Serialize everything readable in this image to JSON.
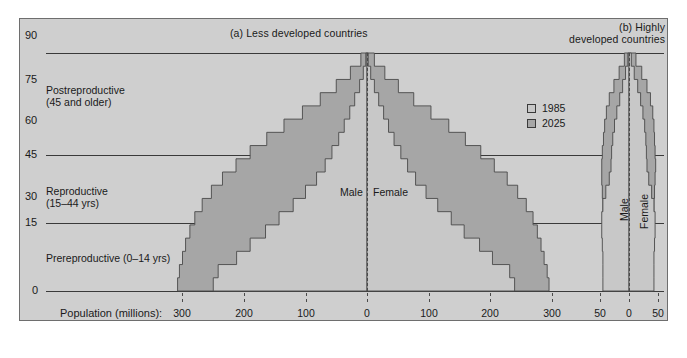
{
  "panels": {
    "left": {
      "title": "(a) Less developed countries"
    },
    "right": {
      "title_line1": "(b) Highly",
      "title_line2": "developed countries"
    }
  },
  "legend": {
    "position": "inside-right-upper",
    "items": [
      {
        "label": "1985",
        "color": "#c8c8c8"
      },
      {
        "label": "2025",
        "color": "#a6a6a6"
      }
    ]
  },
  "axis": {
    "x_title": "Population (millions):",
    "y_ticks": [
      "0",
      "15",
      "30",
      "45",
      "60",
      "75",
      "90"
    ],
    "x_ticks_left": [
      "300",
      "200",
      "100",
      "0",
      "100",
      "200",
      "300"
    ],
    "x_ticks_right": [
      "50",
      "0",
      "50"
    ],
    "gridlines_at": [
      0,
      15,
      45,
      90
    ]
  },
  "age_categories": [
    {
      "name": "Postreproductive",
      "range": "(45 and older)"
    },
    {
      "name": "Reproductive",
      "range": "(15–44 yrs)"
    },
    {
      "name": "Prereproductive (0–14 yrs)",
      "range": ""
    }
  ],
  "gender_labels": {
    "left_male": "Male",
    "left_female": "Female",
    "right_male": "Male",
    "right_female": "Female"
  },
  "chart_data": {
    "type": "bar",
    "subtype": "population-pyramid",
    "xlabel": "Population (millions)",
    "ylabel": "Age",
    "age_bands": [
      "0-4",
      "5-9",
      "10-14",
      "15-19",
      "20-24",
      "25-29",
      "30-34",
      "35-39",
      "40-44",
      "45-49",
      "50-54",
      "55-59",
      "60-64",
      "65-69",
      "70-74",
      "75-79",
      "80-84",
      "85+"
    ],
    "band_height_years": 5,
    "panels": [
      {
        "name": "Less developed countries",
        "xlim": [
          0,
          320
        ],
        "xticks": [
          300,
          200,
          100,
          0,
          100,
          200,
          300
        ],
        "series": [
          {
            "name": "1985",
            "color": "#c8c8c8",
            "male": [
              250,
              242,
              212,
              190,
              165,
              143,
              120,
              100,
              82,
              68,
              57,
              46,
              37,
              28,
              20,
              12,
              6,
              2
            ],
            "female": [
              240,
              232,
              204,
              183,
              158,
              137,
              115,
              96,
              79,
              66,
              55,
              44,
              35,
              27,
              19,
              12,
              6,
              2
            ]
          },
          {
            "name": "2025",
            "color": "#a6a6a6",
            "male": [
              308,
              305,
              300,
              295,
              288,
              280,
              268,
              253,
              235,
              213,
              190,
              163,
              135,
              105,
              76,
              50,
              27,
              10
            ],
            "female": [
              296,
              293,
              288,
              283,
              277,
              270,
              259,
              245,
              228,
              207,
              185,
              160,
              133,
              104,
              76,
              51,
              29,
              12
            ]
          }
        ]
      },
      {
        "name": "Highly developed countries",
        "xlim": [
          0,
          55
        ],
        "xticks": [
          50,
          0,
          50
        ],
        "series": [
          {
            "name": "1985",
            "color": "#c8c8c8",
            "male": [
              45,
              45,
              45,
              46,
              47,
              47,
              45,
              40,
              34,
              31,
              30,
              28,
              25,
              21,
              16,
              11,
              6,
              2
            ],
            "female": [
              43,
              43,
              43,
              44,
              45,
              45,
              43,
              39,
              34,
              31,
              30,
              29,
              27,
              24,
              20,
              15,
              9,
              4
            ]
          },
          {
            "name": "2025",
            "color": "#a6a6a6",
            "male": [
              42,
              42,
              43,
              43,
              44,
              45,
              45,
              46,
              47,
              47,
              46,
              44,
              42,
              39,
              34,
              26,
              17,
              8
            ],
            "female": [
              40,
              40,
              41,
              41,
              42,
              43,
              43,
              44,
              45,
              46,
              45,
              44,
              43,
              41,
              37,
              31,
              22,
              12
            ]
          }
        ]
      }
    ]
  }
}
